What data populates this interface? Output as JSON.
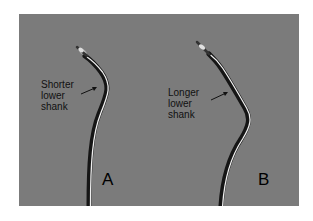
{
  "figure": {
    "background_color": "#7b7b7b",
    "instruments": [
      {
        "id": "A",
        "letter": "A",
        "annotation": {
          "line1": "Shorter",
          "line2": "lower",
          "line3": "shank"
        }
      },
      {
        "id": "B",
        "letter": "B",
        "annotation": {
          "line1": "Longer",
          "line2": "lower",
          "line3": "shank"
        }
      }
    ]
  }
}
